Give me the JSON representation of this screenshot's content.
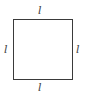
{
  "diagram": {
    "shape": "square",
    "labels": {
      "top": "l",
      "bottom": "l",
      "left": "l",
      "right": "l"
    },
    "stroke_color": "#3a3a3a"
  }
}
